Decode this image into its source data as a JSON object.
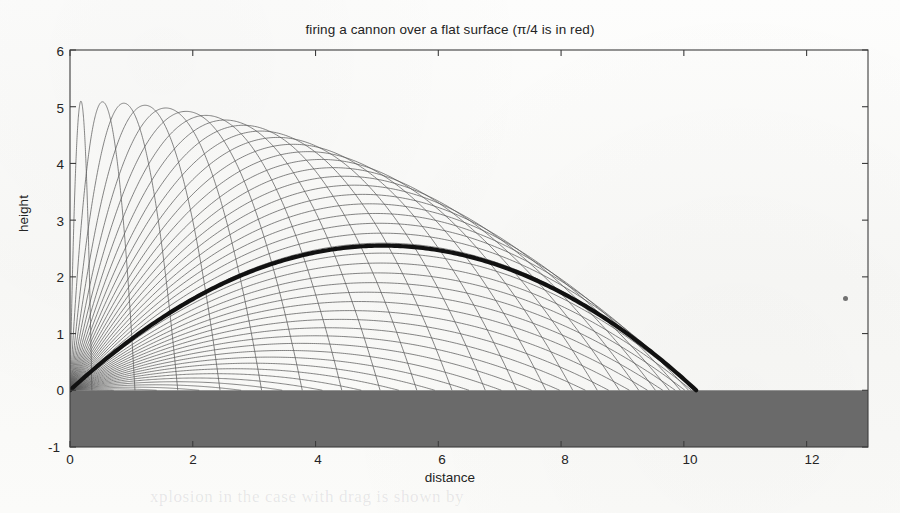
{
  "figure": {
    "title": "firing a cannon over a flat surface (π/4 is in red)",
    "xlabel": "distance",
    "ylabel": "height",
    "background_color": "#fbfbfa",
    "axes_color": "#3c3c3c",
    "ground_color": "#6a6a6a",
    "trajectory_color": "#5a5a5a",
    "highlight_color": "#111111"
  },
  "chart_data": {
    "type": "line",
    "title": "firing a cannon over a flat surface (π/4 is in red)",
    "xlabel": "distance",
    "ylabel": "height",
    "xlim": [
      0,
      13
    ],
    "ylim": [
      -1,
      6
    ],
    "xticks": [
      0,
      2,
      4,
      6,
      8,
      10,
      12
    ],
    "yticks": [
      -1,
      0,
      1,
      2,
      3,
      4,
      5,
      6
    ],
    "grid": false,
    "legend": "none",
    "physics": {
      "model": "ideal projectile, no drag",
      "v_squared_over_g": 10.2,
      "launch_origin": [
        0,
        0
      ],
      "equation": "y = x*tan(theta) - g*x^2 / (2*v^2*cos^2(theta))",
      "range_formula": "R = (v^2/g)*sin(2*theta)",
      "apex_formula": "H = (v^2/(2g))*sin^2(theta)"
    },
    "series": [
      {
        "name": "theta = pi/36 (5 deg)",
        "theta_rad": 0.0873,
        "range": 1.77,
        "apex": 0.039
      },
      {
        "name": "theta = pi/18 (10 deg)",
        "theta_rad": 0.1745,
        "range": 3.49,
        "apex": 0.154
      },
      {
        "name": "theta = pi/12 (15 deg)",
        "theta_rad": 0.2618,
        "range": 5.1,
        "apex": 0.342
      },
      {
        "name": "theta = pi/9 (20 deg)",
        "theta_rad": 0.3491,
        "range": 6.56,
        "apex": 0.597
      },
      {
        "name": "theta = 25 deg",
        "theta_rad": 0.4363,
        "range": 7.81,
        "apex": 0.911
      },
      {
        "name": "theta = pi/6 (30 deg)",
        "theta_rad": 0.5236,
        "range": 8.83,
        "apex": 1.275
      },
      {
        "name": "theta = 35 deg",
        "theta_rad": 0.6109,
        "range": 9.58,
        "apex": 1.678
      },
      {
        "name": "theta = 40 deg",
        "theta_rad": 0.6981,
        "range": 10.05,
        "apex": 2.107
      },
      {
        "name": "theta = pi/4 (45 deg) [highlighted, red in original]",
        "theta_rad": 0.7854,
        "range": 10.2,
        "apex": 2.55,
        "highlight": true
      },
      {
        "name": "theta = 50 deg",
        "theta_rad": 0.8727,
        "range": 10.05,
        "apex": 2.993
      },
      {
        "name": "theta = 55 deg",
        "theta_rad": 0.9599,
        "range": 9.58,
        "apex": 3.422
      },
      {
        "name": "theta = pi/3 (60 deg)",
        "theta_rad": 1.0472,
        "range": 8.83,
        "apex": 3.825
      },
      {
        "name": "theta = 65 deg",
        "theta_rad": 1.1345,
        "range": 7.81,
        "apex": 4.189
      },
      {
        "name": "theta = 70 deg",
        "theta_rad": 1.2217,
        "range": 6.56,
        "apex": 4.503
      },
      {
        "name": "theta = 75 deg",
        "theta_rad": 1.309,
        "range": 5.1,
        "apex": 4.758
      },
      {
        "name": "theta = 80 deg",
        "theta_rad": 1.3963,
        "range": 3.49,
        "apex": 4.946
      },
      {
        "name": "theta = 85 deg",
        "theta_rad": 1.4835,
        "range": 1.77,
        "apex": 5.061
      },
      {
        "name": "theta = ~88 deg (max apex)",
        "theta_rad": 1.5359,
        "range": 0.71,
        "apex": 5.115
      }
    ],
    "annotations": [
      {
        "text": "ground (filled gray band)",
        "y_from": -1,
        "y_to": 0
      }
    ],
    "n_trajectories": 45,
    "theta_start_deg": 2,
    "theta_end_deg": 89
  },
  "artifacts": {
    "speck_label": "scan-speck",
    "ghost_text": "xplosion in the case with drag is shown by"
  }
}
